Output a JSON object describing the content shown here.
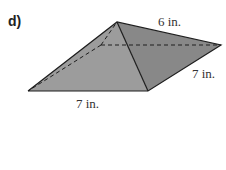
{
  "problem": {
    "label": "d)",
    "figure": "square-based pyramid (rectangular base)",
    "dimensions": {
      "slant_edge_label": "6 in.",
      "base_depth_label": "7 in.",
      "base_width_label": "7 in."
    }
  },
  "colors": {
    "front_face": "#9c9c9c",
    "right_face": "#888888",
    "edge": "#1e1e1e"
  }
}
